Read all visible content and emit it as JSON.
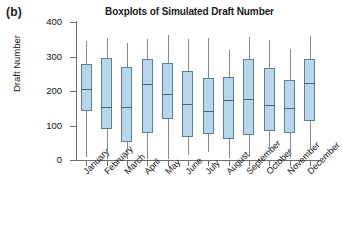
{
  "panel": {
    "label": "(b)"
  },
  "chart_data": {
    "type": "box",
    "title": "Boxplots of Simulated Draft Number",
    "xlabel": "",
    "ylabel": "Draft Number",
    "ylim": [
      0,
      400
    ],
    "yticks": [
      0,
      100,
      200,
      300,
      400
    ],
    "ytick_labels": [
      "0",
      "100",
      "200",
      "300",
      "400"
    ],
    "grid": false,
    "legend": null,
    "categories": [
      "January",
      "February",
      "March",
      "April",
      "May",
      "June",
      "July",
      "August",
      "September",
      "October",
      "November",
      "December"
    ],
    "boxes": [
      {
        "category": "January",
        "whisker_low": 10,
        "q1": 142,
        "median": 205,
        "q3": 277,
        "whisker_high": 345
      },
      {
        "category": "February",
        "whisker_low": 3,
        "q1": 90,
        "median": 155,
        "q3": 295,
        "whisker_high": 353
      },
      {
        "category": "March",
        "whisker_low": 2,
        "q1": 51,
        "median": 153,
        "q3": 270,
        "whisker_high": 340
      },
      {
        "category": "April",
        "whisker_low": 3,
        "q1": 77,
        "median": 220,
        "q3": 292,
        "whisker_high": 352
      },
      {
        "category": "May",
        "whisker_low": 2,
        "q1": 118,
        "median": 190,
        "q3": 282,
        "whisker_high": 362
      },
      {
        "category": "June",
        "whisker_low": 14,
        "q1": 66,
        "median": 162,
        "q3": 257,
        "whisker_high": 350
      },
      {
        "category": "July",
        "whisker_low": 22,
        "q1": 74,
        "median": 141,
        "q3": 238,
        "whisker_high": 355
      },
      {
        "category": "August",
        "whisker_low": 5,
        "q1": 60,
        "median": 175,
        "q3": 242,
        "whisker_high": 318
      },
      {
        "category": "September",
        "whisker_low": 8,
        "q1": 72,
        "median": 178,
        "q3": 292,
        "whisker_high": 356
      },
      {
        "category": "October",
        "whisker_low": 20,
        "q1": 83,
        "median": 160,
        "q3": 268,
        "whisker_high": 348
      },
      {
        "category": "November",
        "whisker_low": 6,
        "q1": 78,
        "median": 151,
        "q3": 232,
        "whisker_high": 322
      },
      {
        "category": "December",
        "whisker_low": 28,
        "q1": 113,
        "median": 222,
        "q3": 293,
        "whisker_high": 358
      }
    ],
    "colors": {
      "box_fill": "#b9d7ec",
      "box_edge": "#5f7f93",
      "median": "#4a6473",
      "whisker": "#8a8a8a",
      "axis": "#6e6e6e"
    }
  }
}
